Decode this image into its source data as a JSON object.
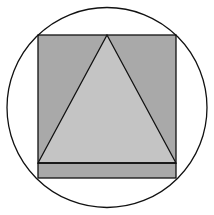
{
  "diagram": {
    "colors": {
      "background": "#ffffff",
      "square_fill": "#a9a9a9",
      "triangle_fill": "#c4c4c4",
      "stroke": "#111111"
    },
    "circle": {
      "cx": 107,
      "cy": 107.5,
      "r": 100
    },
    "square": {
      "x": 38,
      "y": 35,
      "width": 138,
      "height": 143
    },
    "triangle": {
      "apex": [
        107,
        35
      ],
      "base_left": [
        38,
        163
      ],
      "base_right": [
        176,
        163
      ]
    },
    "base_line_y": 163
  }
}
